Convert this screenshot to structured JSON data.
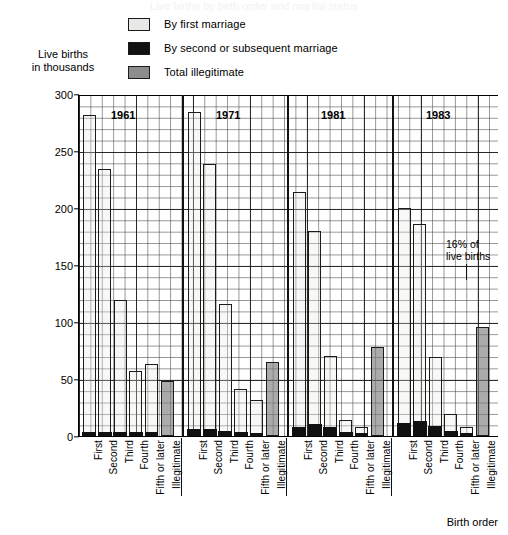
{
  "title": "Live births by birth order and marital status",
  "axis": {
    "y_caption_line1": "Live births",
    "y_caption_line2": "in thousands",
    "x_caption": "Birth order",
    "yticks": [
      "300",
      "250",
      "200",
      "150",
      "100",
      "50",
      "0"
    ]
  },
  "legend": [
    {
      "key": "first",
      "label": "By first marriage",
      "color": "#e8e8e6"
    },
    {
      "key": "second",
      "label": "By second or subsequent marriage",
      "color": "#121212"
    },
    {
      "key": "illeg",
      "label": "Total illegitimate",
      "color": "#8d8d8d"
    }
  ],
  "annotation": {
    "line1": "16% of",
    "line2": "live births"
  },
  "chart_data": {
    "type": "bar",
    "title": "Live births by birth order and marital status",
    "xlabel": "Birth order",
    "ylabel": "Live births in thousands",
    "ylim": [
      0,
      300
    ],
    "ytick_step": 50,
    "grid": true,
    "legend_position": "top-center",
    "stacked": true,
    "groups": [
      "1961",
      "1971",
      "1981",
      "1983"
    ],
    "categories": [
      "First",
      "Second",
      "Third",
      "Fourth",
      "Fifth or later",
      "Illegitimate"
    ],
    "series": [
      {
        "name": "By first marriage",
        "color": "#e8e8e6"
      },
      {
        "name": "By second or subsequent marriage",
        "color": "#121212"
      },
      {
        "name": "Total illegitimate",
        "color": "#8d8d8d"
      }
    ],
    "bars": [
      {
        "group": "1961",
        "category": "First",
        "type": "first",
        "total": 282,
        "first_marriage": 278,
        "second_marriage": 4
      },
      {
        "group": "1961",
        "category": "Second",
        "type": "first",
        "total": 234,
        "first_marriage": 230,
        "second_marriage": 4
      },
      {
        "group": "1961",
        "category": "Third",
        "type": "first",
        "total": 119,
        "first_marriage": 115,
        "second_marriage": 4
      },
      {
        "group": "1961",
        "category": "Fourth",
        "type": "first",
        "total": 57,
        "first_marriage": 53,
        "second_marriage": 4
      },
      {
        "group": "1961",
        "category": "Fifth or later",
        "type": "first",
        "total": 63,
        "first_marriage": 59,
        "second_marriage": 4
      },
      {
        "group": "1961",
        "category": "Illegitimate",
        "type": "illeg",
        "total": 48,
        "first_marriage": 0,
        "second_marriage": 0
      },
      {
        "group": "1971",
        "category": "First",
        "type": "first",
        "total": 284,
        "first_marriage": 278,
        "second_marriage": 6
      },
      {
        "group": "1971",
        "category": "Second",
        "type": "first",
        "total": 239,
        "first_marriage": 233,
        "second_marriage": 6
      },
      {
        "group": "1971",
        "category": "Third",
        "type": "first",
        "total": 116,
        "first_marriage": 111,
        "second_marriage": 5
      },
      {
        "group": "1971",
        "category": "Fourth",
        "type": "first",
        "total": 41,
        "first_marriage": 37,
        "second_marriage": 4
      },
      {
        "group": "1971",
        "category": "Fifth or later",
        "type": "first",
        "total": 32,
        "first_marriage": 29,
        "second_marriage": 3
      },
      {
        "group": "1971",
        "category": "Illegitimate",
        "type": "illeg",
        "total": 65,
        "first_marriage": 0,
        "second_marriage": 0
      },
      {
        "group": "1981",
        "category": "First",
        "type": "first",
        "total": 214,
        "first_marriage": 206,
        "second_marriage": 8
      },
      {
        "group": "1981",
        "category": "Second",
        "type": "first",
        "total": 180,
        "first_marriage": 169,
        "second_marriage": 11
      },
      {
        "group": "1981",
        "category": "Third",
        "type": "first",
        "total": 70,
        "first_marriage": 62,
        "second_marriage": 8
      },
      {
        "group": "1981",
        "category": "Fourth",
        "type": "first",
        "total": 14,
        "first_marriage": 10,
        "second_marriage": 4
      },
      {
        "group": "1981",
        "category": "Fifth or later",
        "type": "first",
        "total": 8,
        "first_marriage": 6,
        "second_marriage": 2
      },
      {
        "group": "1981",
        "category": "Illegitimate",
        "type": "illeg",
        "total": 78,
        "first_marriage": 0,
        "second_marriage": 0
      },
      {
        "group": "1983",
        "category": "First",
        "type": "first",
        "total": 200,
        "first_marriage": 188,
        "second_marriage": 12
      },
      {
        "group": "1983",
        "category": "Second",
        "type": "first",
        "total": 186,
        "first_marriage": 173,
        "second_marriage": 13
      },
      {
        "group": "1983",
        "category": "Third",
        "type": "first",
        "total": 69,
        "first_marriage": 60,
        "second_marriage": 9
      },
      {
        "group": "1983",
        "category": "Fourth",
        "type": "first",
        "total": 19,
        "first_marriage": 14,
        "second_marriage": 5
      },
      {
        "group": "1983",
        "category": "Fifth or later",
        "type": "first",
        "total": 8,
        "first_marriage": 5,
        "second_marriage": 3
      },
      {
        "group": "1983",
        "category": "Illegitimate",
        "type": "illeg",
        "total": 96,
        "first_marriage": 0,
        "second_marriage": 0
      }
    ],
    "annotations": [
      {
        "text": "16% of live births",
        "target_group": "1983",
        "target_category": "Illegitimate"
      }
    ]
  }
}
